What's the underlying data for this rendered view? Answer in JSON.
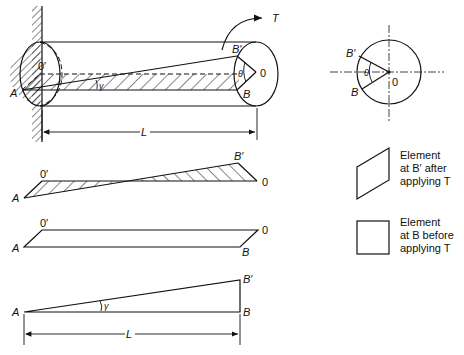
{
  "figure": {
    "main_view": {
      "labels": {
        "A": "A",
        "O_prime": "0′",
        "O": "0",
        "B": "B",
        "B_prime": "B′",
        "theta": "θ",
        "gamma": "γ",
        "T": "T",
        "L": "L"
      }
    },
    "cross_section": {
      "labels": {
        "B_prime": "B′",
        "B": "B",
        "theta": "θ",
        "O": "0"
      }
    },
    "twisted_strip": {
      "labels": {
        "O_prime": "0′",
        "A": "A",
        "B_prime": "B′",
        "O": "0"
      }
    },
    "untwisted_strip": {
      "labels": {
        "O_prime": "0′",
        "A": "A",
        "O": "0",
        "B": "B"
      }
    },
    "shear_triangle": {
      "labels": {
        "A": "A",
        "B_prime": "B′",
        "B": "B",
        "gamma": "γ",
        "L": "L"
      }
    },
    "legend": [
      {
        "line1": "Element",
        "line2": "at B′ after",
        "line3": "applying T"
      },
      {
        "line1": "Element",
        "line2": "at B before",
        "line3": "applying T"
      }
    ]
  },
  "colors": {
    "ink": "#111111",
    "background": "#ffffff"
  }
}
